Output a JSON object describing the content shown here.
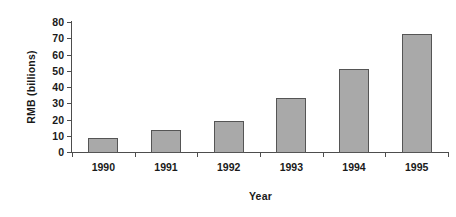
{
  "chart_data": {
    "type": "bar",
    "title": "",
    "xlabel": "Year",
    "ylabel": "RMB (billions)",
    "categories": [
      "1990",
      "1991",
      "1992",
      "1993",
      "1994",
      "1995"
    ],
    "values": [
      9,
      14,
      20,
      34,
      52,
      73
    ],
    "ylim": [
      0,
      80
    ],
    "ytick_step": 10,
    "yticks": [
      "80",
      "70",
      "60",
      "50",
      "40",
      "30",
      "20",
      "10",
      "0"
    ],
    "grid": false,
    "legend": "none",
    "series": [
      {
        "name": "RMB (billions)",
        "values": [
          9,
          14,
          20,
          34,
          52,
          73
        ]
      }
    ],
    "colors": {
      "bar_fill": "#a9a9a9",
      "bar_border": "#555555",
      "axis": "#4d4d4d",
      "text": "#1a1a1a",
      "background": "#ffffff"
    }
  }
}
